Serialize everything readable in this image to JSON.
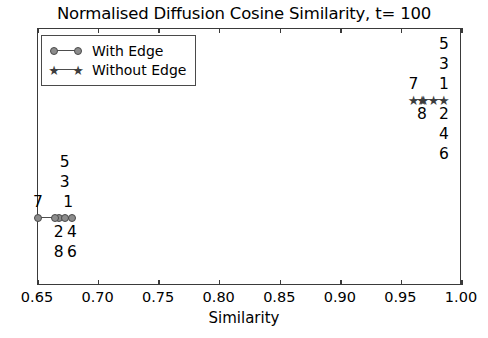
{
  "chart_data": {
    "type": "scatter",
    "title": "Normalised Diffusion Cosine Similarity, t= 100",
    "xlabel": "Similarity",
    "ylabel": "",
    "xlim": [
      0.65,
      1.0
    ],
    "ylim": [
      0,
      1
    ],
    "grid": false,
    "xticks": [
      "0.65",
      "0.70",
      "0.75",
      "0.80",
      "0.85",
      "0.90",
      "0.95",
      "1.00"
    ],
    "xtick_values": [
      0.65,
      0.7,
      0.75,
      0.8,
      0.85,
      0.9,
      0.95,
      1.0
    ],
    "yticks": [],
    "legend_position": "upper left",
    "series": [
      {
        "name": "With Edge",
        "marker": "circle",
        "color": "#8c8c8c",
        "line_color": "#4d4d4d",
        "y": 0.5,
        "points": [
          {
            "label": "7",
            "x": 0.65
          },
          {
            "label": "2",
            "x": 0.667
          },
          {
            "label": "4",
            "x": 0.678
          },
          {
            "label": "1",
            "x": 0.678
          },
          {
            "label": "8",
            "x": 0.667
          },
          {
            "label": "6",
            "x": 0.678
          },
          {
            "label": "3",
            "x": 0.672
          },
          {
            "label": "5",
            "x": 0.672
          }
        ],
        "labels_above": [
          "5",
          "3",
          "7",
          "1"
        ],
        "labels_below": [
          "2",
          "4",
          "8",
          "6"
        ]
      },
      {
        "name": "Without Edge",
        "marker": "star",
        "color": "#3d3d3d",
        "line_color": "#4d4d4d",
        "y": 0.5,
        "points": [
          {
            "label": "7",
            "x": 0.96
          },
          {
            "label": "8",
            "x": 0.967
          },
          {
            "label": "2",
            "x": 0.985
          },
          {
            "label": "1",
            "x": 0.985
          },
          {
            "label": "4",
            "x": 0.985
          },
          {
            "label": "6",
            "x": 0.985
          },
          {
            "label": "3",
            "x": 0.985
          },
          {
            "label": "5",
            "x": 0.985
          }
        ],
        "labels_above": [
          "5",
          "3",
          "7",
          "1"
        ],
        "labels_below": [
          "8",
          "2",
          "4",
          "6"
        ]
      }
    ],
    "annotations": {
      "left_cluster": {
        "above": [
          {
            "text": "5",
            "x": 0.672,
            "row": 0
          },
          {
            "text": "3",
            "x": 0.672,
            "row": 1
          },
          {
            "text": "7",
            "x": 0.65,
            "row": 2
          },
          {
            "text": "1",
            "x": 0.675,
            "row": 2
          }
        ],
        "below": [
          {
            "text": "2",
            "x": 0.667,
            "row": 0
          },
          {
            "text": "4",
            "x": 0.678,
            "row": 0
          },
          {
            "text": "8",
            "x": 0.667,
            "row": 1
          },
          {
            "text": "6",
            "x": 0.678,
            "row": 1
          }
        ]
      },
      "right_cluster": {
        "above": [
          {
            "text": "5",
            "x": 0.985,
            "row": 0
          },
          {
            "text": "3",
            "x": 0.985,
            "row": 1
          },
          {
            "text": "7",
            "x": 0.96,
            "row": 2
          },
          {
            "text": "1",
            "x": 0.985,
            "row": 2
          }
        ],
        "below": [
          {
            "text": "8",
            "x": 0.967,
            "row": 0
          },
          {
            "text": "2",
            "x": 0.985,
            "row": 0
          },
          {
            "text": "4",
            "x": 0.985,
            "row": 1
          },
          {
            "text": "6",
            "x": 0.985,
            "row": 2
          }
        ]
      }
    }
  },
  "title": "Normalised Diffusion Cosine Similarity, t= 100",
  "axis": {
    "xlabel": "Similarity",
    "xticks": [
      "0.65",
      "0.70",
      "0.75",
      "0.80",
      "0.85",
      "0.90",
      "0.95",
      "1.00"
    ]
  },
  "legend": {
    "entries": [
      {
        "label": "With Edge",
        "marker": "circle-marker-icon"
      },
      {
        "label": "Without Edge",
        "marker": "star-marker-icon"
      }
    ]
  },
  "point_labels": {
    "left_above": [
      "5",
      "3",
      "7",
      "1"
    ],
    "left_below": [
      "2",
      "4",
      "8",
      "6"
    ],
    "right_above": [
      "5",
      "3",
      "7",
      "1"
    ],
    "right_below": [
      "8",
      "2",
      "4",
      "6"
    ]
  }
}
